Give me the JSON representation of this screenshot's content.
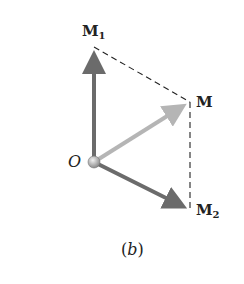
{
  "figure": {
    "caption": "(b)",
    "origin_label": "O",
    "vectors": [
      {
        "name": "M1",
        "label": "M",
        "subscript": "1",
        "color": "#6b6b6b"
      },
      {
        "name": "M",
        "label": "M",
        "subscript": "",
        "color": "#b3b3b3"
      },
      {
        "name": "M2",
        "label": "M",
        "subscript": "2",
        "color": "#6b6b6b"
      }
    ],
    "construction_lines": "dashed parallelogram"
  }
}
